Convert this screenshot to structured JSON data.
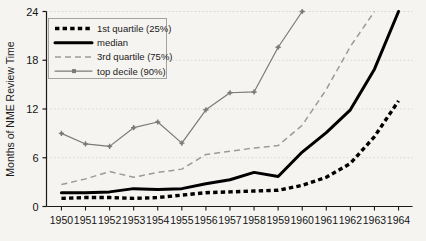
{
  "chart_data": {
    "type": "line",
    "title": "",
    "xlabel": "",
    "ylabel": "Months of NME Review Time",
    "xlim": [
      1950,
      1964
    ],
    "ylim": [
      0,
      24
    ],
    "yticks": [
      0,
      6,
      12,
      18,
      24
    ],
    "grid": true,
    "legend_position": "top-left",
    "x": [
      1950,
      1951,
      1952,
      1953,
      1954,
      1955,
      1956,
      1957,
      1958,
      1959,
      1960,
      1961,
      1962,
      1963,
      1964
    ],
    "series": [
      {
        "name": "1st quartile (25%)",
        "style": "thick-dotted",
        "color": "#000000",
        "values": [
          1.0,
          1.1,
          1.1,
          1.0,
          1.1,
          1.4,
          1.7,
          1.8,
          1.9,
          2.0,
          2.6,
          3.6,
          5.3,
          8.6,
          13.0
        ]
      },
      {
        "name": "median",
        "style": "thick-solid",
        "color": "#000000",
        "values": [
          1.7,
          1.7,
          1.8,
          2.2,
          2.1,
          2.2,
          2.8,
          3.3,
          4.2,
          3.7,
          6.7,
          9.1,
          11.9,
          16.9,
          24.0
        ]
      },
      {
        "name": "3rd quartile (75%)",
        "style": "thin-dashed",
        "color": "#9a9a9a",
        "values": [
          2.7,
          3.4,
          4.3,
          3.6,
          4.2,
          4.6,
          6.4,
          6.8,
          7.2,
          7.5,
          10.0,
          14.4,
          19.7,
          24.0,
          null
        ]
      },
      {
        "name": "top decile (90%)",
        "style": "thin-solid-marker",
        "color": "#7a7a7a",
        "values": [
          9.0,
          7.7,
          7.4,
          9.7,
          10.4,
          7.8,
          11.9,
          14.0,
          14.1,
          19.6,
          24.0,
          null,
          null,
          null,
          null
        ]
      }
    ]
  },
  "yaxis": {
    "label": "Months of NME Review Time",
    "ticks": [
      "0",
      "6",
      "12",
      "18",
      "24"
    ]
  },
  "xaxis": {
    "ticks": [
      "1950",
      "1951",
      "1952",
      "1953",
      "1954",
      "1955",
      "1956",
      "1957",
      "1958",
      "1959",
      "1960",
      "1961",
      "1962",
      "1963",
      "1964"
    ]
  },
  "legend": {
    "items": [
      {
        "label": "1st quartile (25%)"
      },
      {
        "label": "median"
      },
      {
        "label": "3rd quartile (75%)"
      },
      {
        "label": "top decile (90%)"
      }
    ]
  },
  "colors": {
    "background": "#f6f4f1",
    "axis": "#1a1a1a",
    "grid": "#cfcfcf",
    "dark_series": "#000000",
    "light_series": "#9a9a9a",
    "marker_series": "#7a7a7a"
  }
}
